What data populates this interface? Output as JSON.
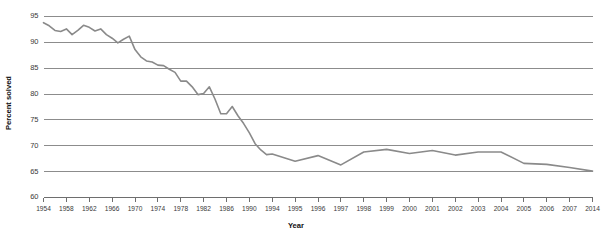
{
  "chart_data": {
    "type": "line",
    "title": "",
    "xlabel": "Year",
    "ylabel": "Percent solved",
    "ylim": [
      60,
      95
    ],
    "yticks": [
      60,
      65,
      70,
      75,
      80,
      85,
      90,
      95
    ],
    "grid": true,
    "legend": "none",
    "xtick_labels": [
      "1954",
      "1958",
      "1962",
      "1966",
      "1970",
      "1974",
      "1978",
      "1982",
      "1986",
      "1990",
      "1994",
      "1995",
      "1996",
      "1997",
      "1998",
      "1999",
      "2000",
      "2001",
      "2002",
      "2003",
      "2004",
      "2005",
      "2006",
      "2007",
      "2014"
    ],
    "x": [
      1954,
      1955,
      1956,
      1957,
      1958,
      1959,
      1960,
      1961,
      1962,
      1963,
      1964,
      1965,
      1966,
      1967,
      1968,
      1969,
      1970,
      1971,
      1972,
      1973,
      1974,
      1975,
      1976,
      1977,
      1978,
      1979,
      1980,
      1981,
      1982,
      1983,
      1984,
      1985,
      1986,
      1987,
      1988,
      1989,
      1990,
      1991,
      1992,
      1993,
      1994,
      1995,
      1996,
      1997,
      1998,
      1999,
      2000,
      2001,
      2002,
      2003,
      2004,
      2005,
      2006,
      2007,
      2014
    ],
    "values": [
      93.8,
      93.2,
      92.3,
      92.1,
      92.6,
      91.5,
      92.3,
      93.3,
      92.9,
      92.2,
      92.6,
      91.5,
      90.8,
      89.9,
      90.6,
      91.2,
      88.6,
      87.2,
      86.4,
      86.2,
      85.6,
      85.5,
      84.8,
      84.2,
      82.5,
      82.5,
      81.4,
      79.9,
      80.1,
      81.4,
      79.0,
      76.2,
      76.2,
      77.6,
      75.8,
      74.3,
      72.5,
      70.4,
      69.2,
      68.3,
      68.4,
      67.0,
      68.1,
      66.3,
      68.8,
      69.3,
      68.5,
      69.1,
      68.2,
      68.8,
      68.8,
      66.6,
      66.4,
      65.8,
      65.1
    ],
    "series_description": "Percent of homicides solved, 1954-2014"
  },
  "axes": {
    "y_axis_label": "Percent solved",
    "x_axis_label": "Year"
  }
}
